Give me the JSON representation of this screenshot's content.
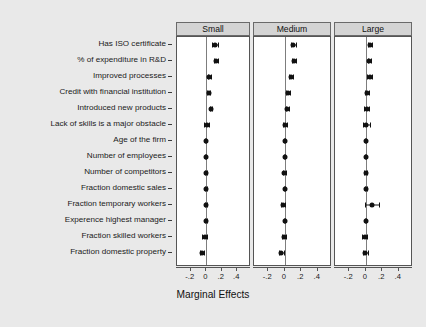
{
  "chart_data": {
    "type": "scatter",
    "plot_style": "coefficient-plot",
    "title": "",
    "xlabel": "Marginal Effects",
    "ylabel": "",
    "xlim": [
      -0.3,
      0.5
    ],
    "xticks": [
      -0.2,
      0,
      0.2,
      0.4
    ],
    "xticklabels": [
      "-.2",
      "0",
      ".2",
      ".4"
    ],
    "grid": false,
    "legend": "none",
    "zero_reference_line": 0,
    "categories": [
      "Has ISO certificate",
      "% of expenditure in R&D",
      "Improved processes",
      "Credit with financial institution",
      "Introduced new products",
      "Lack of skills is a major obstacle",
      "Age of the firm",
      "Number of employees",
      "Number of competitors",
      "Fraction domestic sales",
      "Fraction temporary workers",
      "Experence highest manager",
      "Fraction skilled workers",
      "Fraction domestic property"
    ],
    "panels": [
      {
        "name": "Small",
        "series": [
          {
            "category": "Has ISO certificate",
            "estimate": 0.11,
            "ci_low": 0.072,
            "ci_high": 0.148
          },
          {
            "category": "% of expenditure in R&D",
            "estimate": 0.126,
            "ci_low": 0.103,
            "ci_high": 0.15
          },
          {
            "category": "Improved processes",
            "estimate": 0.039,
            "ci_low": 0.023,
            "ci_high": 0.055
          },
          {
            "category": "Credit with financial institution",
            "estimate": 0.03,
            "ci_low": 0.012,
            "ci_high": 0.048
          },
          {
            "category": "Introduced new products",
            "estimate": 0.06,
            "ci_low": 0.044,
            "ci_high": 0.077
          },
          {
            "category": "Lack of skills is a major obstacle",
            "estimate": 0.007,
            "ci_low": -0.035,
            "ci_high": 0.03
          },
          {
            "category": "Age of the firm",
            "estimate": -0.006,
            "ci_low": -0.012,
            "ci_high": 0.001
          },
          {
            "category": "Number of employees",
            "estimate": -0.005,
            "ci_low": -0.012,
            "ci_high": 0.003
          },
          {
            "category": "Number of competitors",
            "estimate": -0.002,
            "ci_low": -0.018,
            "ci_high": 0.013
          },
          {
            "category": "Fraction domestic sales",
            "estimate": -0.004,
            "ci_low": -0.011,
            "ci_high": 0.004
          },
          {
            "category": "Fraction temporary workers",
            "estimate": -0.003,
            "ci_low": -0.021,
            "ci_high": 0.016
          },
          {
            "category": "Experence highest manager",
            "estimate": -0.004,
            "ci_low": -0.011,
            "ci_high": 0.004
          },
          {
            "category": "Fraction skilled workers",
            "estimate": -0.022,
            "ci_low": -0.049,
            "ci_high": 0.006
          },
          {
            "category": "Fraction domestic property",
            "estimate": -0.055,
            "ci_low": -0.085,
            "ci_high": -0.025
          }
        ]
      },
      {
        "name": "Medium",
        "series": [
          {
            "category": "Has ISO certificate",
            "estimate": 0.105,
            "ci_low": 0.078,
            "ci_high": 0.133
          },
          {
            "category": "% of expenditure in R&D",
            "estimate": 0.111,
            "ci_low": 0.089,
            "ci_high": 0.133
          },
          {
            "category": "Improved processes",
            "estimate": 0.076,
            "ci_low": 0.055,
            "ci_high": 0.097
          },
          {
            "category": "Credit with financial institution",
            "estimate": 0.039,
            "ci_low": 0.02,
            "ci_high": 0.058
          },
          {
            "category": "Introduced new products",
            "estimate": 0.031,
            "ci_low": 0.013,
            "ci_high": 0.049
          },
          {
            "category": "Lack of skills is a major obstacle",
            "estimate": 0.003,
            "ci_low": -0.025,
            "ci_high": 0.03
          },
          {
            "category": "Age of the firm",
            "estimate": -0.002,
            "ci_low": -0.008,
            "ci_high": 0.004
          },
          {
            "category": "Number of employees",
            "estimate": -0.002,
            "ci_low": -0.009,
            "ci_high": 0.005
          },
          {
            "category": "Number of competitors",
            "estimate": -0.004,
            "ci_low": -0.019,
            "ci_high": 0.012
          },
          {
            "category": "Fraction domestic sales",
            "estimate": -0.002,
            "ci_low": -0.009,
            "ci_high": 0.005
          },
          {
            "category": "Fraction temporary workers",
            "estimate": -0.02,
            "ci_low": -0.04,
            "ci_high": 0.0
          },
          {
            "category": "Experence highest manager",
            "estimate": -0.002,
            "ci_low": -0.009,
            "ci_high": 0.005
          },
          {
            "category": "Fraction skilled workers",
            "estimate": -0.011,
            "ci_low": -0.037,
            "ci_high": 0.014
          },
          {
            "category": "Fraction domestic property",
            "estimate": -0.042,
            "ci_low": -0.07,
            "ci_high": -0.014
          }
        ]
      },
      {
        "name": "Large",
        "series": [
          {
            "category": "Has ISO certificate",
            "estimate": 0.051,
            "ci_low": 0.03,
            "ci_high": 0.073
          },
          {
            "category": "% of expenditure in R&D",
            "estimate": 0.045,
            "ci_low": 0.026,
            "ci_high": 0.064
          },
          {
            "category": "Improved processes",
            "estimate": 0.046,
            "ci_low": 0.019,
            "ci_high": 0.073
          },
          {
            "category": "Credit with financial institution",
            "estimate": 0.018,
            "ci_low": -0.004,
            "ci_high": 0.04
          },
          {
            "category": "Introduced new products",
            "estimate": 0.01,
            "ci_low": -0.019,
            "ci_high": 0.039
          },
          {
            "category": "Lack of skills is a major obstacle",
            "estimate": 0.008,
            "ci_low": -0.031,
            "ci_high": 0.047
          },
          {
            "category": "Age of the firm",
            "estimate": 0.001,
            "ci_low": -0.006,
            "ci_high": 0.008
          },
          {
            "category": "Number of employees",
            "estimate": 0.001,
            "ci_low": -0.007,
            "ci_high": 0.009
          },
          {
            "category": "Number of competitors",
            "estimate": 0.0,
            "ci_low": -0.019,
            "ci_high": 0.019
          },
          {
            "category": "Fraction domestic sales",
            "estimate": 0.002,
            "ci_low": -0.007,
            "ci_high": 0.011
          },
          {
            "category": "Fraction temporary workers",
            "estimate": 0.077,
            "ci_low": -0.012,
            "ci_high": 0.166
          },
          {
            "category": "Experence highest manager",
            "estimate": 0.001,
            "ci_low": -0.007,
            "ci_high": 0.009
          },
          {
            "category": "Fraction skilled workers",
            "estimate": -0.01,
            "ci_low": -0.04,
            "ci_high": 0.019
          },
          {
            "category": "Fraction domestic property",
            "estimate": -0.004,
            "ci_low": -0.033,
            "ci_high": 0.025
          }
        ]
      }
    ]
  }
}
